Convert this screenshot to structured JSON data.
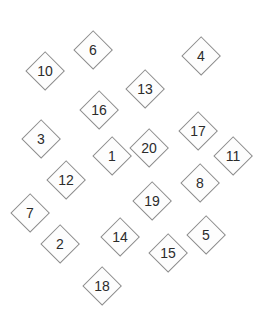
{
  "diagram": {
    "type": "shape-layout",
    "canvas": {
      "width": 265,
      "height": 318,
      "background": "#ffffff"
    },
    "shape_style": {
      "shape": "diamond",
      "fill": "#fdfdfd",
      "stroke": "#8c8c8c",
      "stroke_width": 1,
      "label_color": "#2b2b2b",
      "label_font_size": 14
    },
    "shapes": [
      {
        "id": "shape-10",
        "label": "10",
        "cx": 45,
        "cy": 71,
        "size": 40
      },
      {
        "id": "shape-6",
        "label": "6",
        "cx": 93,
        "cy": 50,
        "size": 40
      },
      {
        "id": "shape-4",
        "label": "4",
        "cx": 201,
        "cy": 56,
        "size": 40
      },
      {
        "id": "shape-13",
        "label": "13",
        "cx": 145,
        "cy": 89,
        "size": 40
      },
      {
        "id": "shape-16",
        "label": "16",
        "cx": 99,
        "cy": 110,
        "size": 40
      },
      {
        "id": "shape-3",
        "label": "3",
        "cx": 41,
        "cy": 139,
        "size": 40
      },
      {
        "id": "shape-17",
        "label": "17",
        "cx": 198,
        "cy": 131,
        "size": 40
      },
      {
        "id": "shape-20",
        "label": "20",
        "cx": 149,
        "cy": 148,
        "size": 40
      },
      {
        "id": "shape-1",
        "label": "1",
        "cx": 112,
        "cy": 156,
        "size": 40
      },
      {
        "id": "shape-11",
        "label": "11",
        "cx": 233,
        "cy": 156,
        "size": 40
      },
      {
        "id": "shape-12",
        "label": "12",
        "cx": 66,
        "cy": 180,
        "size": 40
      },
      {
        "id": "shape-8",
        "label": "8",
        "cx": 200,
        "cy": 183,
        "size": 40
      },
      {
        "id": "shape-19",
        "label": "19",
        "cx": 152,
        "cy": 201,
        "size": 40
      },
      {
        "id": "shape-7",
        "label": "7",
        "cx": 30,
        "cy": 213,
        "size": 40
      },
      {
        "id": "shape-14",
        "label": "14",
        "cx": 120,
        "cy": 237,
        "size": 40
      },
      {
        "id": "shape-5",
        "label": "5",
        "cx": 206,
        "cy": 235,
        "size": 40
      },
      {
        "id": "shape-2",
        "label": "2",
        "cx": 60,
        "cy": 244,
        "size": 40
      },
      {
        "id": "shape-15",
        "label": "15",
        "cx": 168,
        "cy": 253,
        "size": 40
      },
      {
        "id": "shape-18",
        "label": "18",
        "cx": 102,
        "cy": 286,
        "size": 40
      }
    ]
  }
}
